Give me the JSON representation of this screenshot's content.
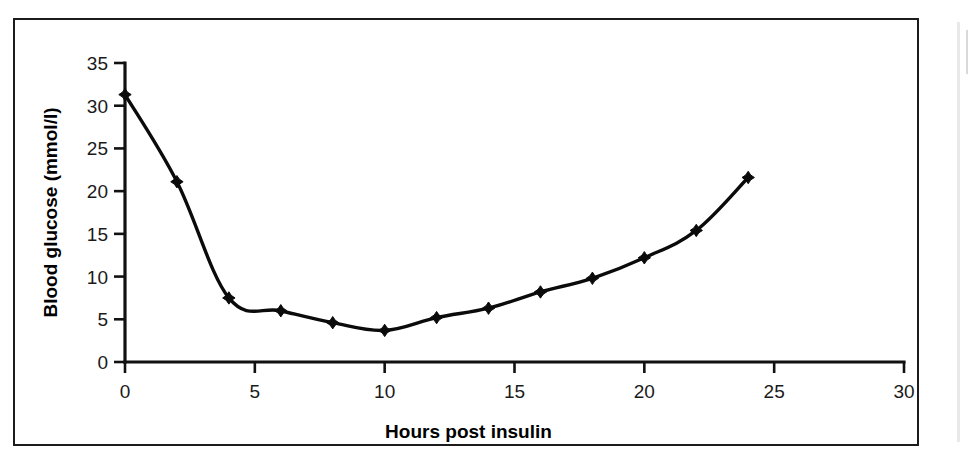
{
  "figure": {
    "frame_color": "#1c1c1c",
    "background": "#ffffff"
  },
  "chart_data": {
    "type": "line",
    "title": "",
    "xlabel": "Hours post insulin",
    "ylabel": "Blood glucose (mmol/l)",
    "x": [
      0,
      2,
      4,
      6,
      8,
      10,
      12,
      14,
      16,
      18,
      20,
      22,
      24
    ],
    "values": [
      31.3,
      21.1,
      7.5,
      6.0,
      4.6,
      3.7,
      5.2,
      6.3,
      8.2,
      9.8,
      12.2,
      15.4,
      21.6
    ],
    "series": [
      {
        "name": "Blood glucose",
        "values": [
          31.3,
          21.1,
          7.5,
          6.0,
          4.6,
          3.7,
          5.2,
          6.3,
          8.2,
          9.8,
          12.2,
          15.4,
          21.6
        ],
        "color": "#0b0b0b",
        "marker": "diamond"
      }
    ],
    "xlim": [
      0,
      30
    ],
    "ylim": [
      0,
      35
    ],
    "xticks": [
      0,
      5,
      10,
      15,
      20,
      25,
      30
    ],
    "yticks": [
      0,
      5,
      10,
      15,
      20,
      25,
      30,
      35
    ],
    "xtick_labels": [
      "0",
      "5",
      "10",
      "15",
      "20",
      "25",
      "30"
    ],
    "ytick_labels": [
      "0",
      "5",
      "10",
      "15",
      "20",
      "25",
      "30",
      "35"
    ],
    "grid": false,
    "legend": null,
    "legend_position": "none",
    "line_color": "#0b0b0b",
    "marker_color": "#0b0b0b"
  }
}
